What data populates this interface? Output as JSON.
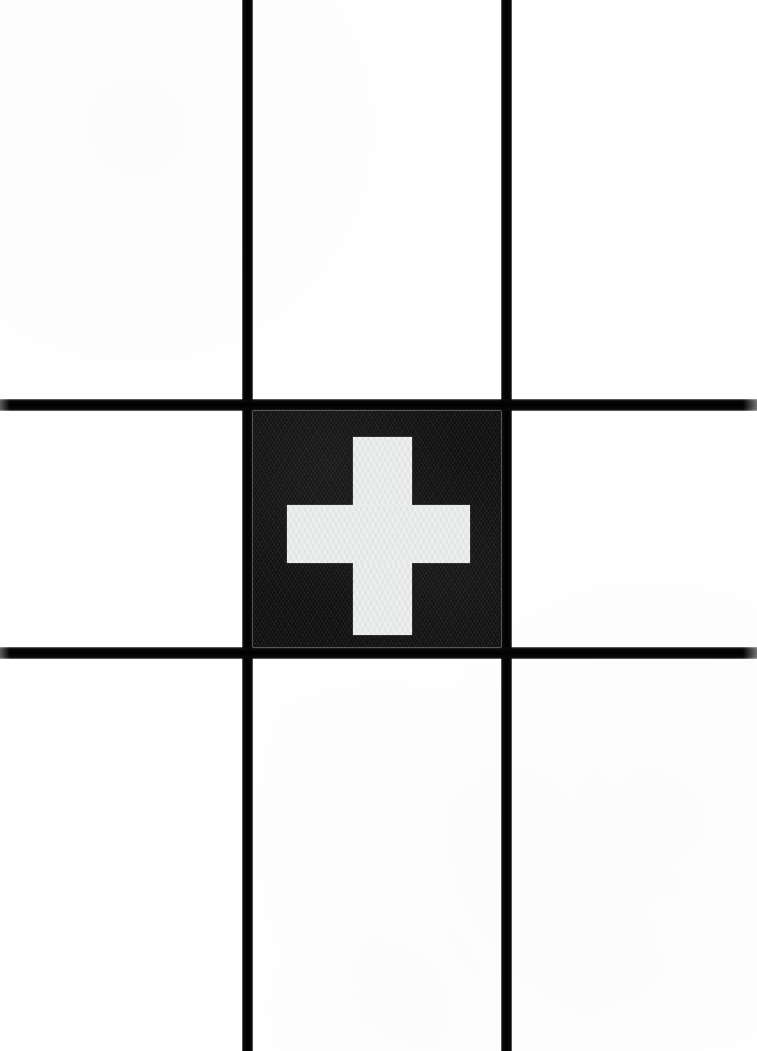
{
  "artwork": {
    "title": "Nine-patch grid with centered cross",
    "width": 757,
    "height": 1051,
    "background_color": "#ffffff"
  },
  "grid": {
    "columns": 3,
    "rows": 3,
    "line_color": "#000000",
    "vertical_lines": [
      {
        "name": "vertical-line-1",
        "x": 242,
        "thickness": 11
      },
      {
        "name": "vertical-line-2",
        "x": 501,
        "thickness": 11
      }
    ],
    "horizontal_lines": [
      {
        "name": "horizontal-line-1",
        "y": 399,
        "thickness": 12
      },
      {
        "name": "horizontal-line-2",
        "y": 647,
        "thickness": 12
      }
    ]
  },
  "center_cell": {
    "name": "center-cell",
    "fill_color": "#151517",
    "texture": "zigzag-chevron-weave",
    "x": 253,
    "y": 411,
    "width": 248,
    "height": 236
  },
  "cross": {
    "name": "cross-symbol",
    "color": "#eceded",
    "vertical_bar": {
      "x": 353,
      "y": 437,
      "width": 59,
      "height": 198
    },
    "horizontal_bar": {
      "x": 287,
      "y": 505,
      "width": 183,
      "height": 58
    }
  },
  "cells": [
    {
      "name": "cell-top-left",
      "row": 0,
      "column": 0,
      "fill": "#ffffff"
    },
    {
      "name": "cell-top-center",
      "row": 0,
      "column": 1,
      "fill": "#ffffff"
    },
    {
      "name": "cell-top-right",
      "row": 0,
      "column": 2,
      "fill": "#ffffff"
    },
    {
      "name": "cell-middle-left",
      "row": 1,
      "column": 0,
      "fill": "#ffffff"
    },
    {
      "name": "cell-middle-center",
      "row": 1,
      "column": 1,
      "fill": "#151517"
    },
    {
      "name": "cell-middle-right",
      "row": 1,
      "column": 2,
      "fill": "#ffffff"
    },
    {
      "name": "cell-bottom-left",
      "row": 2,
      "column": 0,
      "fill": "#ffffff"
    },
    {
      "name": "cell-bottom-center",
      "row": 2,
      "column": 1,
      "fill": "#ffffff"
    },
    {
      "name": "cell-bottom-right",
      "row": 2,
      "column": 2,
      "fill": "#ffffff"
    }
  ]
}
